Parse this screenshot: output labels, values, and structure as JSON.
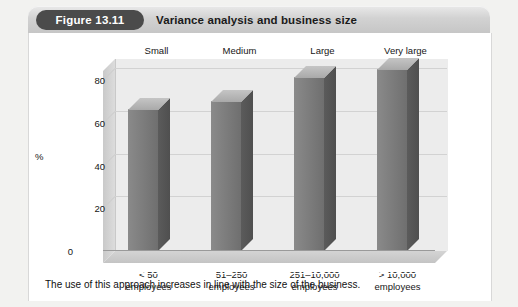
{
  "figure": {
    "badge_label": "Figure 13.11",
    "title": "Variance analysis and business size",
    "caption": "The use of this approach increases in line with the size of the business."
  },
  "colors": {
    "badge_background": "#4b4b4b",
    "header_background": "#d2d2d2",
    "bar_front": "#7a7a7a",
    "bar_side": "#555555",
    "bar_top": "#b8b8b8",
    "plot_background": "#ececec",
    "gridline": "#d2d2d2",
    "panel_background": "#ffffff"
  },
  "chart_data": {
    "type": "bar",
    "title": "Variance analysis and business size",
    "xlabel": "",
    "ylabel": "%",
    "ylim": [
      0,
      90
    ],
    "yticks": [
      0,
      20,
      40,
      60,
      80
    ],
    "grid": true,
    "legend": "none",
    "three_d": true,
    "column_headers": [
      "Small",
      "Medium",
      "Large",
      "Very large"
    ],
    "categories": [
      "< 50\nemployees",
      "51–250\nemployees",
      "251–10,000\nemployees",
      "> 10,000\nemployees"
    ],
    "category_lines": [
      [
        "< 50",
        "employees"
      ],
      [
        "51–250",
        "employees"
      ],
      [
        "251–10,000",
        "employees"
      ],
      [
        "> 10,000",
        "employees"
      ]
    ],
    "values": [
      66,
      70,
      81,
      85
    ]
  }
}
